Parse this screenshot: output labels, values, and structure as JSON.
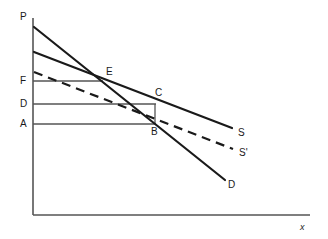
{
  "figure": {
    "background_color": "#ffffff",
    "curve_color": "#1a1a1a",
    "guide_color": "#555555",
    "axis_color": "#555555"
  },
  "axes": {
    "y_label": "P",
    "x_label": "x",
    "origin": {
      "x": 33,
      "y": 215
    },
    "y_top": {
      "x": 33,
      "y": 18
    },
    "x_right": {
      "x": 310,
      "y": 215
    }
  },
  "price_levels": [
    {
      "id": "F",
      "label": "F",
      "y": 81,
      "line_from_x": 33,
      "line_to_x": 103
    },
    {
      "id": "D",
      "label": "D",
      "y": 104,
      "line_from_x": 33,
      "line_to_x": 155
    },
    {
      "id": "A",
      "label": "A",
      "y": 124,
      "line_from_x": 33,
      "line_to_x": 155
    }
  ],
  "points": [
    {
      "id": "E",
      "label": "E",
      "x": 103,
      "y": 81
    },
    {
      "id": "C",
      "label": "C",
      "x": 155,
      "y": 104
    },
    {
      "id": "B",
      "label": "B",
      "x": 155,
      "y": 124
    }
  ],
  "curves": [
    {
      "id": "demand",
      "label": "D",
      "style": "solid",
      "x1": 34,
      "y1": 27,
      "x2": 225,
      "y2": 180
    },
    {
      "id": "supply",
      "label": "S",
      "style": "solid",
      "x1": 34,
      "y1": 52,
      "x2": 232,
      "y2": 128
    },
    {
      "id": "supply-shifted",
      "label": "S'",
      "style": "dashed",
      "x1": 34,
      "y1": 72,
      "x2": 233,
      "y2": 149
    }
  ],
  "curve_labels": [
    {
      "id": "S",
      "label": "S",
      "x": 240,
      "y": 128
    },
    {
      "id": "S-prime",
      "label": "S'",
      "x": 241,
      "y": 148
    },
    {
      "id": "D",
      "label": "D",
      "x": 230,
      "y": 181
    }
  ],
  "vertical_connector": {
    "x": 155,
    "y_top": 104,
    "y_bottom": 124
  }
}
